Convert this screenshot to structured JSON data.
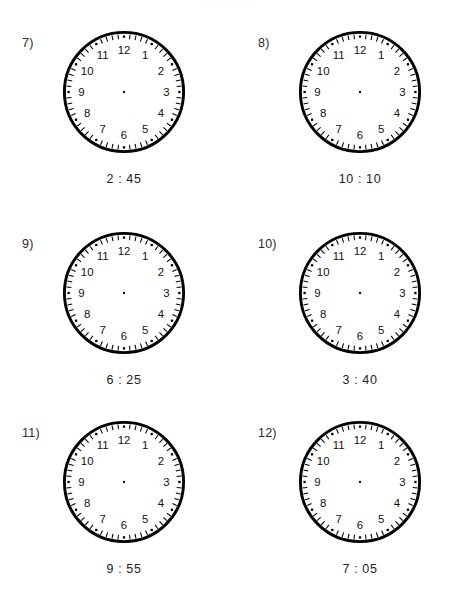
{
  "page": {
    "width": 460,
    "height": 603,
    "background": "#ffffff",
    "header_remnant": "Telling Time",
    "worksheet_type": "blank-clock-faces"
  },
  "clock_style": {
    "numerals": [
      "1",
      "2",
      "3",
      "4",
      "5",
      "6",
      "7",
      "8",
      "9",
      "10",
      "11",
      "12"
    ],
    "minute_tick_count": 60,
    "hour_dot_count": 12,
    "rim_color": "#000000",
    "face_color": "#ffffff",
    "numeral_color": "#111111",
    "has_hands": false,
    "center_dot": true
  },
  "problems": [
    {
      "number": "7)",
      "time": "2 : 45",
      "hour": 2,
      "minute": 45
    },
    {
      "number": "8)",
      "time": "10 : 10",
      "hour": 10,
      "minute": 10
    },
    {
      "number": "9)",
      "time": "6 : 25",
      "hour": 6,
      "minute": 25
    },
    {
      "number": "10)",
      "time": "3 : 40",
      "hour": 3,
      "minute": 40
    },
    {
      "number": "11)",
      "time": "9 : 55",
      "hour": 9,
      "minute": 55
    },
    {
      "number": "12)",
      "time": "7 : 05",
      "hour": 7,
      "minute": 5
    }
  ]
}
